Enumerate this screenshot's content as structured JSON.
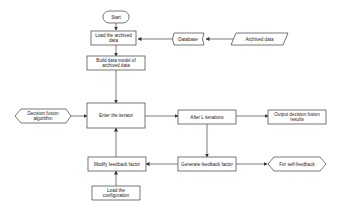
{
  "diagram": {
    "type": "flowchart",
    "nodes": {
      "start": {
        "label": "Start",
        "shape": "terminator"
      },
      "load_archived": {
        "label_lines": [
          "Load the archived",
          "data"
        ],
        "shape": "process"
      },
      "build_model": {
        "label_lines": [
          "Build data model of",
          "archived data"
        ],
        "shape": "process"
      },
      "enter_iterator": {
        "label": "Enter the iterator",
        "shape": "process"
      },
      "decision_fusion": {
        "label_lines": [
          "Decision fusion",
          "algorithm"
        ],
        "shape": "hexagon"
      },
      "after_l": {
        "label": "After L iterations",
        "shape": "process"
      },
      "output_results": {
        "label_lines": [
          "Output decision fusion",
          "results"
        ],
        "shape": "process"
      },
      "modify_feedback": {
        "label": "Modify feedback factor",
        "shape": "process"
      },
      "generate_feedback": {
        "label": "Generate feedback factor",
        "shape": "process"
      },
      "self_feedback": {
        "label": "For self-feedback",
        "shape": "hexagon"
      },
      "load_config": {
        "label_lines": [
          "Load the",
          "configuration"
        ],
        "shape": "process"
      },
      "database": {
        "label": "Database",
        "shape": "stored-data"
      },
      "archived_data": {
        "label": "Archived data",
        "shape": "parallelogram"
      }
    },
    "edges": [
      {
        "from": "start",
        "to": "load_archived"
      },
      {
        "from": "archived_data",
        "to": "database"
      },
      {
        "from": "database",
        "to": "load_archived"
      },
      {
        "from": "load_archived",
        "to": "build_model"
      },
      {
        "from": "build_model",
        "to": "enter_iterator"
      },
      {
        "from": "decision_fusion",
        "to": "enter_iterator"
      },
      {
        "from": "enter_iterator",
        "to": "after_l"
      },
      {
        "from": "after_l",
        "to": "output_results"
      },
      {
        "from": "after_l",
        "to": "generate_feedback"
      },
      {
        "from": "generate_feedback",
        "to": "modify_feedback"
      },
      {
        "from": "generate_feedback",
        "to": "self_feedback"
      },
      {
        "from": "load_config",
        "to": "modify_feedback"
      },
      {
        "from": "modify_feedback",
        "to": "enter_iterator"
      }
    ]
  }
}
